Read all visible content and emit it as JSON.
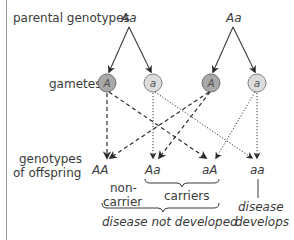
{
  "labels": {
    "parental": "parental genotypes",
    "gametes": "gametes",
    "offspring_line1": "genotypes",
    "offspring_line2": "of offspring"
  },
  "parents": [
    {
      "genotype": "Aa"
    },
    {
      "genotype": "Aa"
    }
  ],
  "gametes": [
    {
      "allele": "A",
      "type": "dominant",
      "fill": "#a9a9a9"
    },
    {
      "allele": "a",
      "type": "recessive",
      "fill": "#dcdcdc"
    },
    {
      "allele": "A",
      "type": "dominant",
      "fill": "#a9a9a9"
    },
    {
      "allele": "a",
      "type": "recessive",
      "fill": "#dcdcdc"
    }
  ],
  "offspring": [
    {
      "genotype": "AA"
    },
    {
      "genotype": "Aa"
    },
    {
      "genotype": "aA"
    },
    {
      "genotype": "aa"
    }
  ],
  "annotations": {
    "noncarrier_line1": "non-",
    "noncarrier_line2": "carrier",
    "carriers": "carriers",
    "not_developed": "disease not developed",
    "develops_line1": "disease",
    "develops_line2": "develops"
  },
  "colors": {
    "line": "#3a3a3a",
    "dominant_gamete": "#a9a9a9",
    "recessive_gamete": "#dcdcdc",
    "frame": "#9a9a9a"
  }
}
